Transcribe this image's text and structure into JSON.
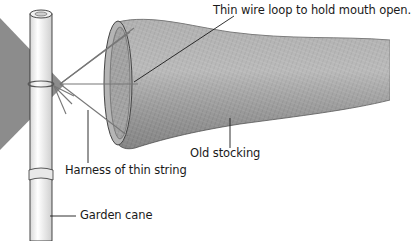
{
  "diagram": {
    "labels": {
      "wire_loop": "Thin wire loop to hold mouth open.",
      "stocking": "Old stocking",
      "harness": "Harness of thin string",
      "cane": "Garden cane"
    },
    "colors": {
      "background": "#ffffff",
      "stocking": "#9a9a9a",
      "stocking_light": "#c4c4c4",
      "vane": "#8c8c8c",
      "cane": "#f4f4f4",
      "outline": "#333333",
      "text": "#1a1a1a"
    }
  }
}
